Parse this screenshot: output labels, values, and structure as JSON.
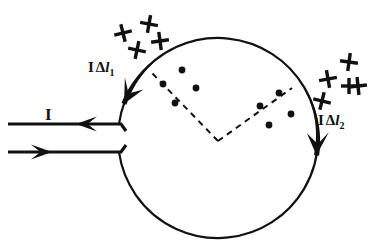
{
  "figure": {
    "background_color": "#ffffff",
    "ink_color": "#111111",
    "width": 383,
    "height": 250
  },
  "labels": {
    "current_left": "I",
    "element_1_current": "I",
    "element_1_delta": "Δ",
    "element_1_var": "l",
    "element_1_sub": "1",
    "element_2_current": "I",
    "element_2_delta": "Δ",
    "element_2_var": "l",
    "element_2_sub": "2"
  },
  "loop": {
    "center_x": 218,
    "center_y": 138,
    "radius": 100,
    "stroke_width": 2.2,
    "gap_start_deg": 172,
    "gap_end_deg": 188
  },
  "leads": {
    "upper": {
      "x1": 8,
      "y1": 124,
      "x2": 114,
      "y2": 124,
      "arrow_dir": "left",
      "arrow_x": 76,
      "arrow_y": 124
    },
    "lower": {
      "x1": 8,
      "y1": 152,
      "x2": 114,
      "y2": 152,
      "arrow_dir": "right",
      "arrow_x": 52,
      "arrow_y": 152
    },
    "connector_upper": "M114,124 L121,124 L126,131",
    "connector_lower": "M114,152 L121,152 L126,145",
    "stroke_width": 3.2
  },
  "element_arrows": [
    {
      "name": "delta-l-1",
      "start_angle_deg": 232,
      "end_angle_deg": 200,
      "direction": "counterclockwise",
      "tip_x": 139,
      "tip_y": 77
    },
    {
      "name": "delta-l-2",
      "start_angle_deg": 334,
      "end_angle_deg": 370,
      "direction": "counterclockwise",
      "tip_x": 298,
      "tip_y": 66
    }
  ],
  "dashed_lines": [
    {
      "name": "radius-to-element-1",
      "x1": 218,
      "y1": 141,
      "x2": 152,
      "y2": 73
    },
    {
      "name": "radius-to-element-2",
      "x1": 218,
      "y1": 141,
      "x2": 292,
      "y2": 88
    }
  ],
  "field_dots": [
    {
      "cx": 182,
      "cy": 70
    },
    {
      "cx": 163,
      "cy": 84
    },
    {
      "cx": 196,
      "cy": 88
    },
    {
      "cx": 175,
      "cy": 103
    },
    {
      "cx": 279,
      "cy": 93
    },
    {
      "cx": 260,
      "cy": 106
    },
    {
      "cx": 291,
      "cy": 114
    },
    {
      "cx": 269,
      "cy": 125
    }
  ],
  "dot_radius": 3.4,
  "field_crosses_left": [
    {
      "cx": 123,
      "cy": 33,
      "r": 9,
      "rot": -14
    },
    {
      "cx": 149,
      "cy": 24,
      "r": 9,
      "rot": 10
    },
    {
      "cx": 160,
      "cy": 41,
      "r": 9,
      "rot": -8
    },
    {
      "cx": 137,
      "cy": 50,
      "r": 9,
      "rot": 12
    }
  ],
  "field_crosses_right": [
    {
      "cx": 328,
      "cy": 79,
      "r": 9,
      "rot": -10
    },
    {
      "cx": 349,
      "cy": 62,
      "r": 9,
      "rot": 8
    },
    {
      "cx": 358,
      "cy": 86,
      "r": 9,
      "rot": -6
    },
    {
      "cx": 322,
      "cy": 101,
      "r": 9,
      "rot": 14
    },
    {
      "cx": 349,
      "cy": 86,
      "r": 8,
      "rot": 0
    }
  ],
  "label_positions": {
    "current_left": {
      "left": 45,
      "top": 106
    },
    "element_1": {
      "left": 88,
      "top": 60
    },
    "element_2": {
      "left": 318,
      "top": 113
    }
  }
}
